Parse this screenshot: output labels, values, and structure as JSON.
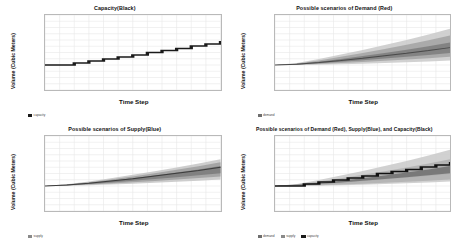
{
  "figure": {
    "background": "#ffffff",
    "panel_count": 4,
    "grid": "2x2"
  },
  "axis_labels": {
    "x": "Time Step",
    "y": "Volume (Cubic Meters)"
  },
  "colors": {
    "capacity": "#1a1a1a",
    "demand": "#6e6e6e",
    "supply": "#8a8a8a",
    "grid": "#e8e8e8",
    "border": "#b9b9b9",
    "tick_text": "#555555"
  },
  "panels": [
    {
      "id": "capacity",
      "title": "Capacity(Black)",
      "legend": [
        {
          "label": "capacity",
          "color": "#1a1a1a"
        }
      ]
    },
    {
      "id": "demand",
      "title": "Possible scenarios of Demand (Red)",
      "legend": [
        {
          "label": "demand",
          "color": "#6e6e6e"
        }
      ]
    },
    {
      "id": "supply",
      "title": "Possible scenarios of Supply(Blue)",
      "legend": [
        {
          "label": "supply",
          "color": "#8a8a8a"
        }
      ]
    },
    {
      "id": "combined",
      "title": "Possible scenarios of Demand (Red), Supply(Blue), and Capacity(Black)",
      "legend": [
        {
          "label": "demand",
          "color": "#6e6e6e"
        },
        {
          "label": "supply",
          "color": "#8a8a8a"
        },
        {
          "label": "capacity",
          "color": "#1a1a1a"
        }
      ]
    }
  ],
  "chart_data": [
    {
      "type": "line",
      "id": "capacity",
      "title": "Capacity(Black)",
      "xlabel": "Time Step",
      "ylabel": "Volume (Cubic Meters)",
      "xlim": [
        0,
        24
      ],
      "ylim": [
        0,
        300
      ],
      "xticks": [
        0,
        2,
        4,
        6,
        8,
        10,
        12,
        14,
        16,
        18,
        20,
        22,
        24
      ],
      "yticks": [
        0,
        25,
        50,
        75,
        100,
        125,
        150,
        175,
        200,
        225,
        250,
        275,
        300
      ],
      "grid": true,
      "legend_position": "below-axes-left",
      "drawstyle": "steps-post",
      "series": [
        {
          "name": "capacity",
          "color": "#1a1a1a",
          "x": [
            0,
            2,
            4,
            6,
            8,
            10,
            12,
            14,
            16,
            18,
            20,
            22,
            24
          ],
          "values": [
            100,
            100,
            108,
            116,
            124,
            132,
            140,
            150,
            158,
            166,
            176,
            184,
            196
          ]
        }
      ]
    },
    {
      "type": "area",
      "id": "demand",
      "title": "Possible scenarios of Demand (Red)",
      "xlabel": "Time Step",
      "ylabel": "Volume (Cubic Meters)",
      "xlim": [
        0,
        24
      ],
      "ylim": [
        0,
        300
      ],
      "xticks": [
        0,
        2,
        4,
        6,
        8,
        10,
        12,
        14,
        16,
        18,
        20,
        22,
        24
      ],
      "yticks": [
        0,
        25,
        50,
        75,
        100,
        125,
        150,
        175,
        200,
        225,
        250,
        275,
        300
      ],
      "grid": true,
      "legend_position": "below-axes-left",
      "description": "Monte-Carlo fan: many overlapping scenario paths widening with time",
      "x": [
        0,
        3,
        6,
        9,
        12,
        15,
        18,
        21,
        24
      ],
      "bands": [
        {
          "name": "outer",
          "color": "#c9c9c9",
          "lower": [
            100,
            100,
            101,
            103,
            105,
            108,
            111,
            114,
            118
          ],
          "upper": [
            100,
            108,
            124,
            142,
            160,
            180,
            200,
            222,
            246
          ]
        },
        {
          "name": "mid",
          "color": "#a3a3a3",
          "lower": [
            100,
            101,
            104,
            108,
            112,
            117,
            122,
            127,
            133
          ],
          "upper": [
            100,
            106,
            118,
            133,
            148,
            164,
            181,
            199,
            218
          ]
        },
        {
          "name": "inner",
          "color": "#7d7d7d",
          "lower": [
            100,
            102,
            107,
            113,
            119,
            126,
            133,
            140,
            148
          ],
          "upper": [
            100,
            105,
            113,
            124,
            136,
            148,
            161,
            175,
            190
          ]
        }
      ],
      "median": {
        "name": "demand-median",
        "color": "#4a4a4a",
        "values": [
          100,
          103,
          110,
          118,
          127,
          137,
          147,
          158,
          170
        ]
      }
    },
    {
      "type": "area",
      "id": "supply",
      "title": "Possible scenarios of Supply(Blue)",
      "xlabel": "Time Step",
      "ylabel": "Volume (Cubic Meters)",
      "xlim": [
        0,
        24
      ],
      "ylim": [
        0,
        300
      ],
      "xticks": [
        0,
        2,
        4,
        6,
        8,
        10,
        12,
        14,
        16,
        18,
        20,
        22,
        24
      ],
      "yticks": [
        0,
        25,
        50,
        75,
        100,
        125,
        150,
        175,
        200,
        225,
        250,
        275,
        300
      ],
      "grid": true,
      "legend_position": "below-axes-left",
      "description": "Narrower fan than demand, with a dark upper boundary line",
      "x": [
        0,
        3,
        6,
        9,
        12,
        15,
        18,
        21,
        24
      ],
      "bands": [
        {
          "name": "outer",
          "color": "#c4c4c4",
          "lower": [
            100,
            101,
            103,
            106,
            109,
            113,
            117,
            121,
            126
          ],
          "upper": [
            100,
            107,
            118,
            131,
            145,
            159,
            174,
            190,
            207
          ]
        },
        {
          "name": "mid",
          "color": "#9e9e9e",
          "lower": [
            100,
            102,
            106,
            110,
            115,
            120,
            126,
            132,
            138
          ],
          "upper": [
            100,
            106,
            115,
            126,
            138,
            151,
            165,
            179,
            195
          ]
        },
        {
          "name": "inner",
          "color": "#7a7a7a",
          "lower": [
            100,
            103,
            108,
            114,
            121,
            128,
            135,
            143,
            151
          ],
          "upper": [
            100,
            105,
            112,
            121,
            131,
            142,
            154,
            166,
            180
          ]
        }
      ],
      "median": {
        "name": "supply-median",
        "color": "#3d3d3d",
        "values": [
          100,
          104,
          111,
          120,
          129,
          140,
          151,
          162,
          175
        ]
      }
    },
    {
      "type": "area",
      "id": "combined",
      "title": "Possible scenarios of Demand (Red), Supply(Blue), and Capacity(Black)",
      "xlabel": "Time Step",
      "ylabel": "Volume (Cubic Meters)",
      "xlim": [
        0,
        24
      ],
      "ylim": [
        0,
        300
      ],
      "xticks": [
        0,
        2,
        4,
        6,
        8,
        10,
        12,
        14,
        16,
        18,
        20,
        22,
        24
      ],
      "yticks": [
        0,
        25,
        50,
        75,
        100,
        125,
        150,
        175,
        200,
        225,
        250,
        275,
        300
      ],
      "grid": true,
      "legend_position": "below-axes-left",
      "description": "Demand and supply fans overlaid with the capacity staircase on top",
      "x": [
        0,
        3,
        6,
        9,
        12,
        15,
        18,
        21,
        24
      ],
      "bands": [
        {
          "name": "demand-outer",
          "color": "#c9c9c9",
          "lower": [
            100,
            100,
            101,
            103,
            105,
            108,
            111,
            114,
            118
          ],
          "upper": [
            100,
            108,
            124,
            142,
            160,
            180,
            200,
            222,
            246
          ]
        },
        {
          "name": "demand-inner",
          "color": "#9a9a9a",
          "lower": [
            100,
            102,
            107,
            113,
            119,
            126,
            133,
            140,
            148
          ],
          "upper": [
            100,
            105,
            113,
            124,
            136,
            148,
            161,
            175,
            190
          ]
        },
        {
          "name": "supply-outer",
          "color": "#b0b0b0",
          "lower": [
            100,
            101,
            103,
            106,
            109,
            113,
            117,
            121,
            126
          ],
          "upper": [
            100,
            107,
            118,
            131,
            145,
            159,
            174,
            190,
            207
          ]
        },
        {
          "name": "supply-inner",
          "color": "#707070",
          "lower": [
            100,
            103,
            108,
            114,
            121,
            128,
            135,
            143,
            151
          ],
          "upper": [
            100,
            105,
            112,
            121,
            131,
            142,
            154,
            166,
            180
          ]
        }
      ],
      "capacity": {
        "name": "capacity",
        "color": "#111111",
        "drawstyle": "steps-post",
        "x": [
          0,
          2,
          4,
          6,
          8,
          10,
          12,
          14,
          16,
          18,
          20,
          22,
          24
        ],
        "values": [
          100,
          100,
          108,
          116,
          124,
          132,
          140,
          150,
          158,
          166,
          176,
          184,
          196
        ]
      }
    }
  ]
}
